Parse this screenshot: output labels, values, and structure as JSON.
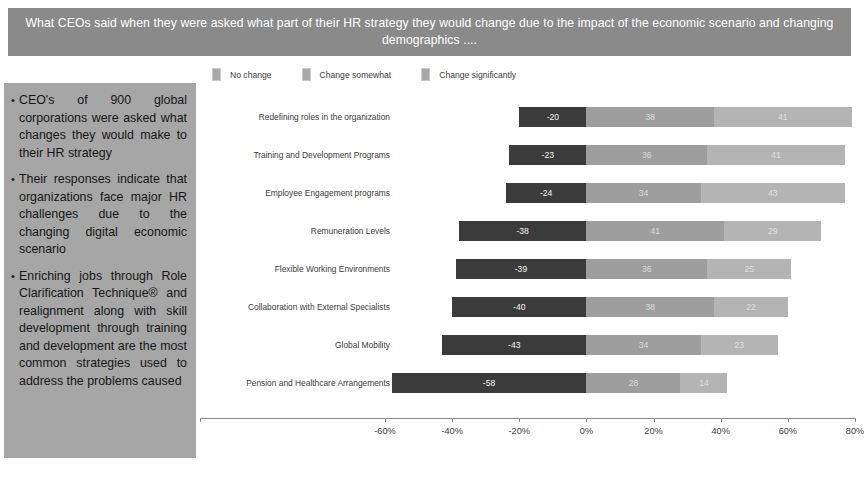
{
  "title": {
    "text": "What  CEOs said when they were asked what part of their HR strategy they would change due to the impact of the economic scenario and changing demographics ...."
  },
  "side_panel": {
    "bullet_marker": "•",
    "bullets": [
      "CEO's of 900 global corporations were asked what changes they would make to their HR strategy",
      "Their responses indicate that organizations face major HR challenges due to the changing digital economic scenario",
      "Enriching jobs through Role Clarification Technique® and realignment along with skill development through training and development are the most common strategies used to address the problems caused"
    ]
  },
  "colors": {
    "banner": "#8a8a8a",
    "panel": "#a6a6a6",
    "no_change": "#3b3b3b",
    "change_somewhat": "#9e9e9e",
    "change_significantly": "#b4b4b4"
  },
  "chart_data": {
    "type": "bar",
    "orientation": "horizontal",
    "stacked": true,
    "title": "",
    "xlabel": "",
    "ylabel": "",
    "grid": false,
    "legend_position": "top-left",
    "xlim": [
      -60,
      80
    ],
    "xticks": [
      -60,
      -40,
      -20,
      0,
      20,
      40,
      60,
      80
    ],
    "xticklabels": [
      "-60%",
      "-40%",
      "-20%",
      "0%",
      "20%",
      "40%",
      "60%",
      "80%"
    ],
    "categories": [
      "Redefining  roles in the organization",
      "Training and Development Programs",
      "Employee Engagement programs",
      "Remuneration Levels",
      "Flexible Working Environments",
      "Collaboration with External Specialists",
      "Global Mobility",
      "Pension and Healthcare Arrangements"
    ],
    "series": [
      {
        "name": "No change",
        "color": "#3b3b3b",
        "values": [
          -20,
          -23,
          -24,
          -38,
          -39,
          -40,
          -43,
          -58
        ],
        "labels": [
          "-20",
          "-23",
          "-24",
          "-38",
          "-39",
          "-40",
          "-43",
          "-58"
        ]
      },
      {
        "name": "Change somewhat",
        "color": "#9e9e9e",
        "values": [
          38,
          36,
          34,
          41,
          36,
          38,
          34,
          28
        ],
        "labels": [
          "38",
          "36",
          "34",
          "41",
          "36",
          "38",
          "34",
          "28"
        ]
      },
      {
        "name": "Change significantly",
        "color": "#b4b4b4",
        "values": [
          41,
          41,
          43,
          29,
          25,
          22,
          23,
          14
        ],
        "labels": [
          "41",
          "41",
          "43",
          "29",
          "25",
          "22",
          "23",
          "14"
        ]
      }
    ]
  }
}
